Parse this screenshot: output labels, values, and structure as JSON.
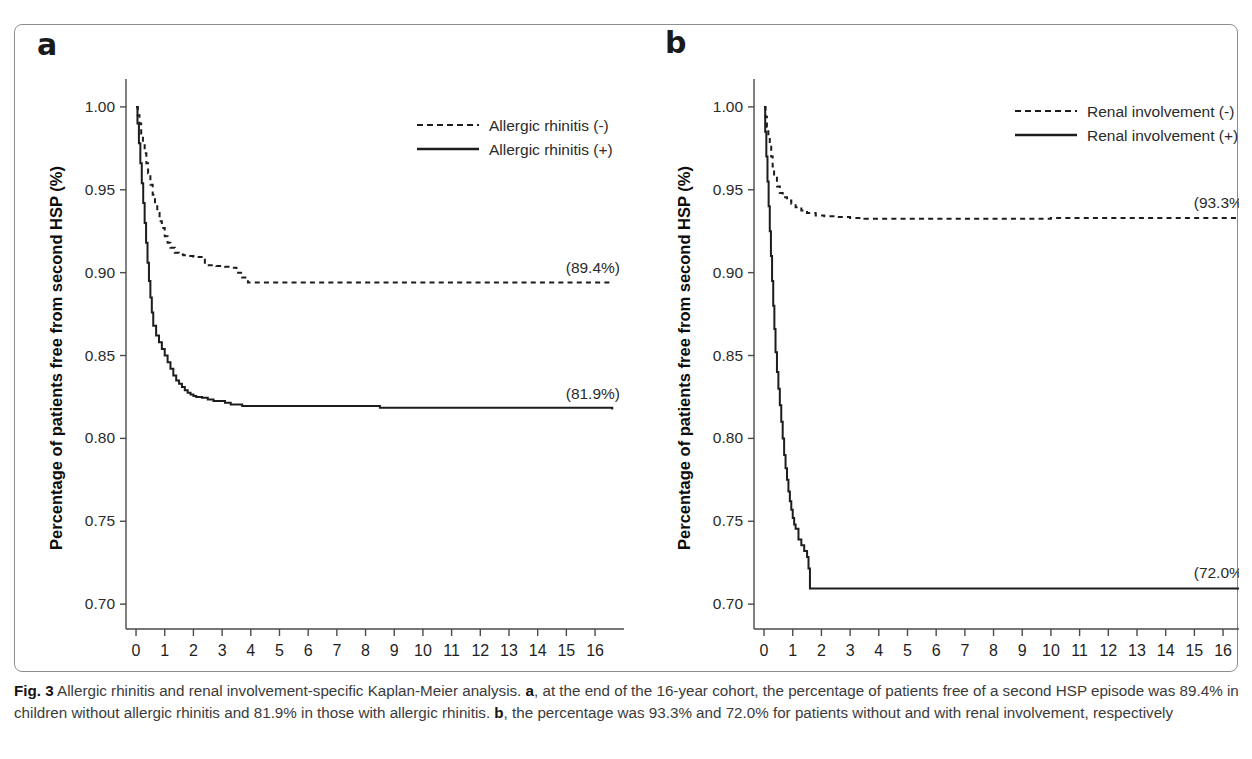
{
  "figure": {
    "caption_prefix": "Fig. 3",
    "caption_line_1": " Allergic rhinitis and renal involvement-specific Kaplan-Meier analysis. ",
    "caption_bold_a": "a",
    "caption_seg_1": ", at the end of the 16-year cohort, the percentage of patients free of a second HSP episode was 89.4% in children without allergic rhinitis and 81.9% in those with allergic rhinitis. ",
    "caption_bold_b": "b",
    "caption_seg_2": ", the percentage was 93.3% and 72.0% for patients without and with renal involvement, respectively",
    "border_color": "#8d8d8d"
  },
  "panel_a": {
    "letter": "a",
    "ylabel": "Percentage of patients free from second HSP (%)",
    "xlabel": "Follow-up time (years)",
    "legend": [
      {
        "label": "Allergic rhinitis (-)",
        "style": "dashed"
      },
      {
        "label": "Allergic rhinitis (+)",
        "style": "solid"
      }
    ],
    "endpoint_labels": [
      {
        "text": "(89.4%)",
        "series": "Allergic rhinitis (-)"
      },
      {
        "text": "(81.9%)",
        "series": "Allergic rhinitis (+)"
      }
    ]
  },
  "panel_b": {
    "letter": "b",
    "ylabel": "Percentage of patients free from second HSP (%)",
    "xlabel": "Follow-up time (years)",
    "legend": [
      {
        "label": "Renal involvement (-)",
        "style": "dashed"
      },
      {
        "label": "Renal involvement (+)",
        "style": "solid"
      }
    ],
    "endpoint_labels": [
      {
        "text": "(93.3%)",
        "series": "Renal involvement (-)"
      },
      {
        "text": "(72.0%)",
        "series": "Renal involvement (+)"
      }
    ]
  },
  "chart_data": [
    {
      "type": "line",
      "title": "a",
      "xlabel": "Follow-up time (years)",
      "ylabel": "Percentage of patients free from second HSP (%)",
      "xlim": [
        -0.35,
        16.8
      ],
      "ylim": [
        0.685,
        1.012
      ],
      "xticks": [
        0,
        1,
        2,
        3,
        4,
        5,
        6,
        7,
        8,
        9,
        10,
        11,
        12,
        13,
        14,
        15,
        16
      ],
      "xtick_labels": [
        "0",
        "1",
        "2",
        "3",
        "4",
        "5",
        "6",
        "7",
        "8",
        "9",
        "10",
        "11",
        "12",
        "13",
        "14",
        "15",
        "16"
      ],
      "yticks": [
        0.7,
        0.75,
        0.8,
        0.85,
        0.9,
        0.95,
        1.0
      ],
      "ytick_labels": [
        "0.70",
        "0.75",
        "0.80",
        "0.85",
        "0.90",
        "0.95",
        "1.00"
      ],
      "grid": false,
      "legend_position": "top-center-right",
      "series": [
        {
          "name": "Allergic rhinitis (-)",
          "style": "dashed",
          "final_value": 0.894,
          "final_label": "(89.4%)",
          "x": [
            0,
            0.06,
            0.12,
            0.18,
            0.24,
            0.3,
            0.36,
            0.42,
            0.5,
            0.58,
            0.66,
            0.74,
            0.82,
            0.9,
            1.0,
            1.1,
            1.2,
            1.35,
            1.5,
            1.65,
            1.8,
            2.0,
            2.4,
            2.8,
            3.1,
            3.3,
            3.5,
            3.7,
            3.9,
            4.0,
            8.0,
            12.0,
            16.6
          ],
          "y": [
            1.0,
            0.995,
            0.99,
            0.984,
            0.978,
            0.972,
            0.966,
            0.96,
            0.953,
            0.947,
            0.941,
            0.936,
            0.931,
            0.927,
            0.922,
            0.918,
            0.915,
            0.912,
            0.911,
            0.9105,
            0.91,
            0.9095,
            0.9045,
            0.904,
            0.9035,
            0.903,
            0.9,
            0.897,
            0.894,
            0.894,
            0.894,
            0.894,
            0.894
          ]
        },
        {
          "name": "Allergic rhinitis (+)",
          "style": "solid",
          "final_value": 0.819,
          "final_label": "(81.9%)",
          "x": [
            0,
            0.05,
            0.1,
            0.15,
            0.2,
            0.25,
            0.3,
            0.35,
            0.4,
            0.45,
            0.5,
            0.55,
            0.6,
            0.7,
            0.8,
            0.9,
            1.0,
            1.1,
            1.2,
            1.3,
            1.4,
            1.5,
            1.6,
            1.7,
            1.8,
            1.9,
            2.0,
            2.1,
            2.3,
            2.5,
            2.7,
            2.9,
            3.1,
            3.3,
            3.5,
            3.7,
            3.9,
            4.0,
            8.4,
            8.5,
            16.6
          ],
          "y": [
            1.0,
            0.99,
            0.978,
            0.966,
            0.954,
            0.942,
            0.93,
            0.918,
            0.906,
            0.895,
            0.885,
            0.876,
            0.868,
            0.862,
            0.858,
            0.854,
            0.85,
            0.846,
            0.842,
            0.838,
            0.835,
            0.833,
            0.831,
            0.829,
            0.8275,
            0.8265,
            0.8255,
            0.825,
            0.8245,
            0.8235,
            0.8225,
            0.8225,
            0.8215,
            0.8205,
            0.8205,
            0.8195,
            0.8195,
            0.8195,
            0.8195,
            0.8185,
            0.8175
          ]
        }
      ]
    },
    {
      "type": "line",
      "title": "b",
      "xlabel": "Follow-up time (years)",
      "ylabel": "Percentage of patients free from second HSP (%)",
      "xlim": [
        -0.35,
        16.8
      ],
      "ylim": [
        0.685,
        1.012
      ],
      "xticks": [
        0,
        1,
        2,
        3,
        4,
        5,
        6,
        7,
        8,
        9,
        10,
        11,
        12,
        13,
        14,
        15,
        16
      ],
      "xtick_labels": [
        "0",
        "1",
        "2",
        "3",
        "4",
        "5",
        "6",
        "7",
        "8",
        "9",
        "10",
        "11",
        "12",
        "13",
        "14",
        "15",
        "16"
      ],
      "yticks": [
        0.7,
        0.75,
        0.8,
        0.85,
        0.9,
        0.95,
        1.0
      ],
      "ytick_labels": [
        "0.70",
        "0.75",
        "0.80",
        "0.85",
        "0.90",
        "0.95",
        "1.00"
      ],
      "grid": false,
      "legend_position": "top-center-right",
      "series": [
        {
          "name": "Renal involvement (-)",
          "style": "dashed",
          "final_value": 0.933,
          "final_label": "(93.3%)",
          "x": [
            0,
            0.05,
            0.1,
            0.15,
            0.2,
            0.25,
            0.3,
            0.35,
            0.45,
            0.55,
            0.65,
            0.8,
            0.95,
            1.1,
            1.3,
            1.5,
            1.8,
            2.1,
            2.5,
            3.0,
            3.5,
            4.0,
            5.0,
            6.0,
            8.0,
            10.0,
            12.0,
            14.0,
            16.6
          ],
          "y": [
            1.0,
            0.994,
            0.988,
            0.982,
            0.976,
            0.97,
            0.964,
            0.958,
            0.952,
            0.948,
            0.9455,
            0.9435,
            0.9415,
            0.9395,
            0.9375,
            0.936,
            0.9345,
            0.934,
            0.9335,
            0.933,
            0.9325,
            0.9325,
            0.9325,
            0.9325,
            0.9325,
            0.933,
            0.933,
            0.933,
            0.933
          ]
        },
        {
          "name": "Renal involvement (+)",
          "style": "solid",
          "final_value": 0.72,
          "final_label": "(72.0%)",
          "x": [
            0,
            0.04,
            0.08,
            0.12,
            0.16,
            0.2,
            0.24,
            0.28,
            0.32,
            0.36,
            0.4,
            0.45,
            0.5,
            0.55,
            0.6,
            0.65,
            0.7,
            0.75,
            0.8,
            0.85,
            0.9,
            0.95,
            1.0,
            1.05,
            1.1,
            1.15,
            1.2,
            1.3,
            1.4,
            1.5,
            1.55,
            1.6,
            16.6
          ],
          "y": [
            1.0,
            0.985,
            0.97,
            0.955,
            0.94,
            0.925,
            0.91,
            0.895,
            0.88,
            0.866,
            0.852,
            0.84,
            0.83,
            0.82,
            0.81,
            0.8,
            0.79,
            0.782,
            0.775,
            0.768,
            0.762,
            0.757,
            0.752,
            0.748,
            0.7455,
            0.7455,
            0.739,
            0.7355,
            0.732,
            0.7285,
            0.7215,
            0.7095,
            0.7095
          ]
        }
      ]
    }
  ]
}
